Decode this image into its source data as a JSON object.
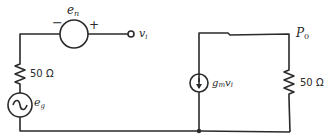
{
  "diagram": {
    "type": "circuit-schematic",
    "input_circuit": {
      "noise_source": {
        "label": "e",
        "subscript": "n",
        "minus": "−",
        "plus": "+"
      },
      "input_node": {
        "label": "v",
        "subscript": "i"
      },
      "source_resistor": {
        "label": "50 Ω"
      },
      "signal_source": {
        "label": "e",
        "subscript": "g"
      }
    },
    "output_circuit": {
      "current_source": {
        "label_g": "g",
        "label_sub": "m",
        "label_v": "v",
        "label_vsub": "i"
      },
      "load_resistor": {
        "label": "50 Ω"
      },
      "output_node": {
        "label": "P",
        "subscript": "0"
      }
    }
  }
}
